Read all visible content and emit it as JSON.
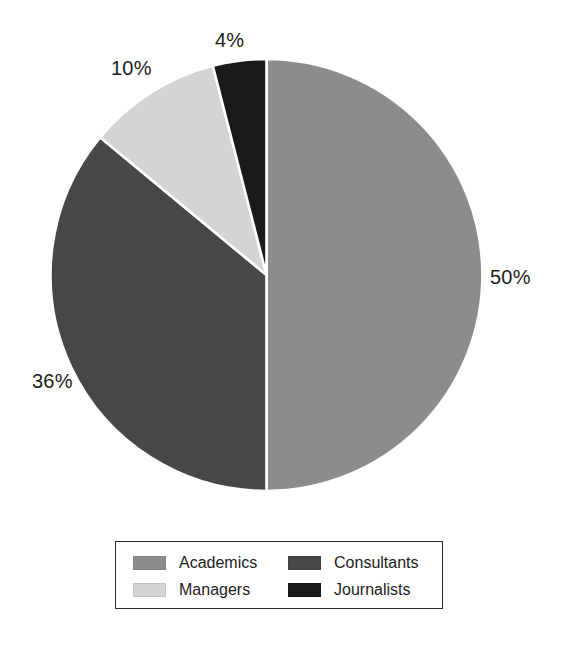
{
  "chart_data": {
    "type": "pie",
    "title": "",
    "subtitle": "",
    "xlabel": "",
    "ylabel": "",
    "categories": [
      "Academics",
      "Consultants",
      "Managers",
      "Journalists"
    ],
    "values": [
      50,
      36,
      10,
      4
    ],
    "value_unit": "%",
    "slices": [
      {
        "label": "Academics",
        "value": 50,
        "display": "50%",
        "color": "#8c8c8c"
      },
      {
        "label": "Consultants",
        "value": 36,
        "display": "36%",
        "color": "#474747"
      },
      {
        "label": "Managers",
        "value": 10,
        "display": "10%",
        "color": "#d4d4d4"
      },
      {
        "label": "Journalists",
        "value": 4,
        "display": "4%",
        "color": "#1a1a1a"
      }
    ],
    "start_angle_deg": 0,
    "direction": "clockwise",
    "separator_color": "#ffffff",
    "background": "#ffffff",
    "grid": false,
    "legend_position": "bottom",
    "legend": [
      {
        "label": "Academics",
        "color": "#8c8c8c"
      },
      {
        "label": "Consultants",
        "color": "#474747"
      },
      {
        "label": "Managers",
        "color": "#d4d4d4"
      },
      {
        "label": "Journalists",
        "color": "#1a1a1a"
      }
    ]
  },
  "labels": {
    "academics_pct": "50%",
    "consultants_pct": "36%",
    "managers_pct": "10%",
    "journalists_pct": "4%"
  },
  "legend": {
    "academics": "Academics",
    "consultants": "Consultants",
    "managers": "Managers",
    "journalists": "Journalists"
  }
}
